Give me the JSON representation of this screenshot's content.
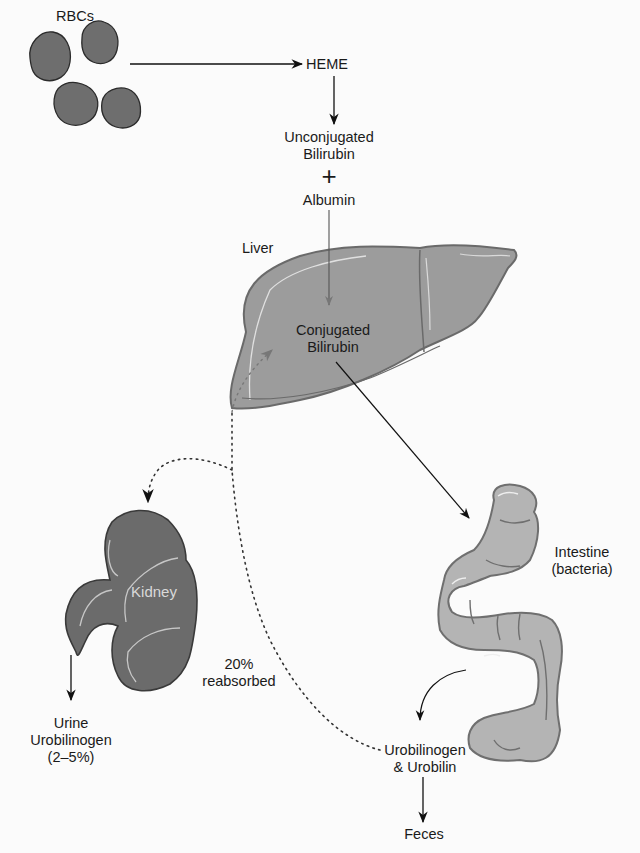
{
  "figure": {
    "colors": {
      "rbc": "#6e6e6e",
      "liver": "#9c9c9c",
      "kidney": "#6b6b6b",
      "intestine": "#b4b4b4",
      "arrow": "#111111",
      "background": "#fbfbfb"
    },
    "nodes": {
      "rbcs": "RBCs",
      "heme": "HEME",
      "unconjugated_line1": "Unconjugated",
      "unconjugated_line2": "Bilirubin",
      "plus": "+",
      "albumin": "Albumin",
      "liver": "Liver",
      "conjugated_line1": "Conjugated",
      "conjugated_line2": "Bilirubin",
      "kidney": "Kidney",
      "intestine_line1": "Intestine",
      "intestine_line2": "(bacteria)",
      "reabsorbed_line1": "20%",
      "reabsorbed_line2": "reabsorbed",
      "urine_line1": "Urine",
      "urine_line2": "Urobilinogen",
      "urine_line3": "(2–5%)",
      "urobilin_line1": "Urobilinogen",
      "urobilin_line2": "& Urobilin",
      "feces": "Feces"
    },
    "edges": [
      {
        "from": "RBCs",
        "to": "HEME",
        "style": "solid"
      },
      {
        "from": "HEME",
        "to": "Unconjugated Bilirubin",
        "style": "solid"
      },
      {
        "from": "Albumin",
        "to": "Conjugated Bilirubin",
        "style": "solid"
      },
      {
        "from": "Conjugated Bilirubin",
        "to": "Intestine (bacteria)",
        "style": "solid"
      },
      {
        "from": "Intestine (bacteria)",
        "to": "Urobilinogen & Urobilin",
        "style": "solid"
      },
      {
        "from": "Urobilinogen & Urobilin",
        "to": "Feces",
        "style": "solid"
      },
      {
        "from": "Urobilinogen & Urobilin",
        "to": "Liver",
        "style": "dotted",
        "label": "20% reabsorbed"
      },
      {
        "from": "Liver",
        "to": "Kidney",
        "style": "dotted"
      },
      {
        "from": "Kidney",
        "to": "Urine Urobilinogen (2–5%)",
        "style": "solid"
      }
    ]
  }
}
